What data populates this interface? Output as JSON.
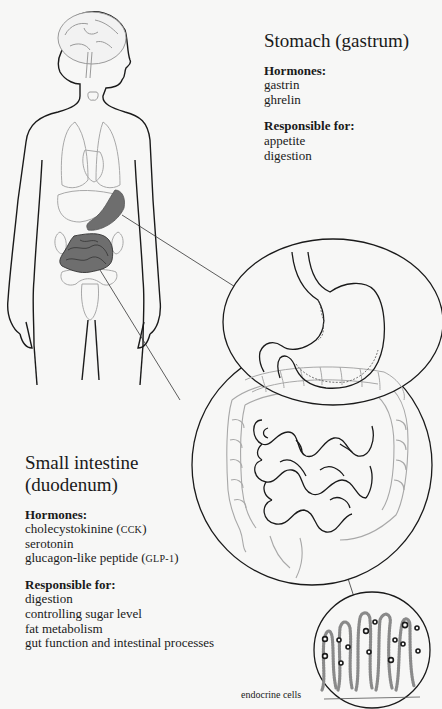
{
  "stomach": {
    "title": "Stomach (gastrum)",
    "hormones_heading": "Hormones:",
    "hormones": [
      "gastrin",
      "ghrelin"
    ],
    "responsible_heading": "Responsible for:",
    "responsible": [
      "appetite",
      "digestion"
    ]
  },
  "small_intestine": {
    "title_line1": "Small intestine",
    "title_line2": "(duodenum)",
    "hormones_heading": "Hormones:",
    "hormones": [
      {
        "name": "cholecystokinine (",
        "abbr": "CCK",
        "close": ")"
      },
      {
        "name": "serotonin",
        "abbr": "",
        "close": ""
      },
      {
        "name": "glucagon-like peptide (",
        "abbr": "GLP-1",
        "close": ")"
      }
    ],
    "responsible_heading": "Responsible for:",
    "responsible": [
      "digestion",
      "controlling sugar level",
      "fat metabolism",
      "gut function and intestinal processes"
    ]
  },
  "villi": {
    "label": "endocrine cells"
  },
  "colors": {
    "outline": "#1a1a1a",
    "organ_outline": "#9a9a9a",
    "highlight_fill": "#6e6e6e",
    "background": "#f7f7f6"
  }
}
